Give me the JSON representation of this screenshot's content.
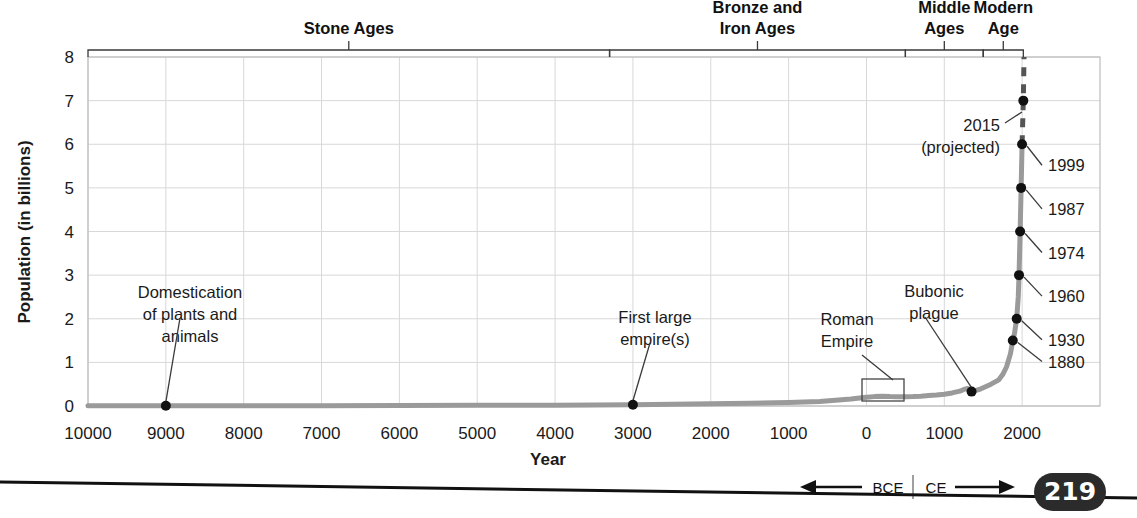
{
  "page": {
    "number": "219",
    "badge_color": "#2b2b2b"
  },
  "chart_data": {
    "type": "line",
    "title": "",
    "xlabel": "Year",
    "ylabel": "Population (in billions)",
    "ylim": [
      0,
      8
    ],
    "grid": true,
    "legend": "none",
    "y_ticks": [
      "0",
      "1",
      "2",
      "3",
      "4",
      "5",
      "6",
      "7",
      "8"
    ],
    "x_ticks": [
      {
        "label": "10000",
        "year": -10000
      },
      {
        "label": "9000",
        "year": -9000
      },
      {
        "label": "8000",
        "year": -8000
      },
      {
        "label": "7000",
        "year": -7000
      },
      {
        "label": "6000",
        "year": -6000
      },
      {
        "label": "5000",
        "year": -5000
      },
      {
        "label": "4000",
        "year": -4000
      },
      {
        "label": "3000",
        "year": -3000
      },
      {
        "label": "2000",
        "year": -2000
      },
      {
        "label": "1000",
        "year": -1000
      },
      {
        "label": "0",
        "year": 0
      },
      {
        "label": "1000",
        "year": 1000
      },
      {
        "label": "2000",
        "year": 2000
      }
    ],
    "xlim": [
      -10000,
      3000
    ],
    "era_axis_note": {
      "bce_label": "BCE",
      "ce_label": "CE",
      "bce_arrow": "left-arrow",
      "ce_arrow": "right-arrow"
    },
    "series": [
      {
        "name": "World population",
        "color": "#9a9a9a",
        "points": [
          [
            -10000,
            0.004
          ],
          [
            -9500,
            0.004
          ],
          [
            -9000,
            0.005
          ],
          [
            -8000,
            0.005
          ],
          [
            -7000,
            0.007
          ],
          [
            -6000,
            0.01
          ],
          [
            -5000,
            0.015
          ],
          [
            -4000,
            0.02
          ],
          [
            -3000,
            0.03
          ],
          [
            -2500,
            0.04
          ],
          [
            -2000,
            0.05
          ],
          [
            -1500,
            0.065
          ],
          [
            -1000,
            0.08
          ],
          [
            -800,
            0.09
          ],
          [
            -600,
            0.105
          ],
          [
            -400,
            0.13
          ],
          [
            -200,
            0.16
          ],
          [
            0,
            0.2
          ],
          [
            100,
            0.215
          ],
          [
            200,
            0.225
          ],
          [
            300,
            0.215
          ],
          [
            400,
            0.21
          ],
          [
            500,
            0.21
          ],
          [
            600,
            0.215
          ],
          [
            700,
            0.225
          ],
          [
            800,
            0.24
          ],
          [
            900,
            0.25
          ],
          [
            1000,
            0.27
          ],
          [
            1100,
            0.3
          ],
          [
            1200,
            0.34
          ],
          [
            1250,
            0.38
          ],
          [
            1300,
            0.4
          ],
          [
            1350,
            0.33
          ],
          [
            1400,
            0.35
          ],
          [
            1450,
            0.38
          ],
          [
            1500,
            0.42
          ],
          [
            1600,
            0.5
          ],
          [
            1700,
            0.6
          ],
          [
            1750,
            0.72
          ],
          [
            1800,
            0.9
          ],
          [
            1850,
            1.2
          ],
          [
            1880,
            1.5
          ],
          [
            1900,
            1.65
          ],
          [
            1930,
            2.0
          ],
          [
            1950,
            2.5
          ],
          [
            1960,
            3.0
          ],
          [
            1974,
            4.0
          ],
          [
            1987,
            5.0
          ],
          [
            1999,
            6.0
          ]
        ]
      }
    ],
    "projection": {
      "name": "Projected",
      "color": "#555555",
      "style": "dashed",
      "points": [
        [
          1999,
          6.0
        ],
        [
          2015,
          7.0
        ],
        [
          2024,
          8.0
        ]
      ]
    },
    "milestones": [
      {
        "label": "1880",
        "year": 1880,
        "value": 1.5
      },
      {
        "label": "1930",
        "year": 1930,
        "value": 2.0
      },
      {
        "label": "1960",
        "year": 1960,
        "value": 3.0
      },
      {
        "label": "1974",
        "year": 1974,
        "value": 4.0
      },
      {
        "label": "1987",
        "year": 1987,
        "value": 5.0
      },
      {
        "label": "1999",
        "year": 1999,
        "value": 6.0
      }
    ],
    "annotations": [
      {
        "name": "domestication",
        "lines": [
          "Domestication",
          "of plants and",
          "animals"
        ],
        "year": -9000,
        "value": 0.005
      },
      {
        "name": "first-large-empires",
        "lines": [
          "First large",
          "empire(s)"
        ],
        "year": -3000,
        "value": 0.03
      },
      {
        "name": "roman-empire",
        "lines": [
          "Roman",
          "Empire"
        ],
        "year": 200,
        "value": 0.225
      },
      {
        "name": "bubonic-plague",
        "lines": [
          "Bubonic",
          "plague"
        ],
        "year": 1350,
        "value": 0.33
      },
      {
        "name": "projected-2015",
        "lines": [
          "2015",
          "(projected)"
        ],
        "year": 2015,
        "value": 7.0
      }
    ],
    "eras": [
      {
        "label_lines": [
          "Stone Ages"
        ],
        "start_year": -10000,
        "end_year": -3300
      },
      {
        "label_lines": [
          "Bronze and",
          "Iron Ages"
        ],
        "start_year": -3300,
        "end_year": 500
      },
      {
        "label_lines": [
          "Middle",
          "Ages"
        ],
        "start_year": 500,
        "end_year": 1500
      },
      {
        "label_lines": [
          "Modern",
          "Age"
        ],
        "start_year": 1500,
        "end_year": 2015
      }
    ]
  }
}
